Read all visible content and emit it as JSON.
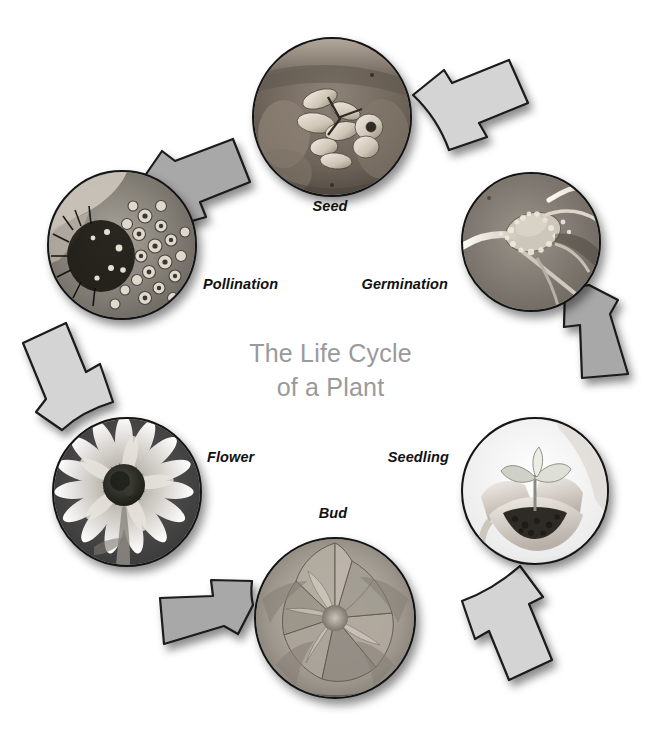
{
  "diagram": {
    "title_line1": "The Life Cycle",
    "title_line2": "of a Plant",
    "title_color": "#9a9a9a",
    "background_color": "#ffffff",
    "arrow_fill_light": "#d4d4d4",
    "arrow_fill_dark": "#a8a8a8",
    "arrow_outline": "#1a1a1a",
    "direction": "clockwise",
    "stage_count": 6
  },
  "stages": [
    {
      "label": "Seed",
      "icon": "seeds-in-hand-photo",
      "position": "top",
      "order": 1,
      "cx": 330,
      "cy": 115,
      "r": 78,
      "label_x": 330,
      "label_y": 205,
      "label_align": "center"
    },
    {
      "label": "Germination",
      "icon": "germinating-seed-photo",
      "position": "top-right",
      "order": 2,
      "cx": 529,
      "cy": 240,
      "r": 68,
      "label_x": 448,
      "label_y": 283,
      "label_align": "right"
    },
    {
      "label": "Seedling",
      "icon": "seedling-in-hands-photo",
      "position": "bottom-right",
      "order": 3,
      "cx": 533,
      "cy": 489,
      "r": 72,
      "label_x": 449,
      "label_y": 456,
      "label_align": "right"
    },
    {
      "label": "Bud",
      "icon": "flower-bud-photo",
      "position": "bottom",
      "order": 4,
      "cx": 333,
      "cy": 616,
      "r": 79,
      "label_x": 333,
      "label_y": 512,
      "label_align": "center"
    },
    {
      "label": "Flower",
      "icon": "sunflower-photo",
      "position": "bottom-left",
      "order": 5,
      "cx": 125,
      "cy": 490,
      "r": 73,
      "label_x": 207,
      "label_y": 456,
      "label_align": "left"
    },
    {
      "label": "Pollination",
      "icon": "pollen-closeup-photo",
      "position": "top-left",
      "order": 6,
      "cx": 120,
      "cy": 243,
      "r": 73,
      "label_x": 203,
      "label_y": 283,
      "label_align": "left"
    }
  ]
}
